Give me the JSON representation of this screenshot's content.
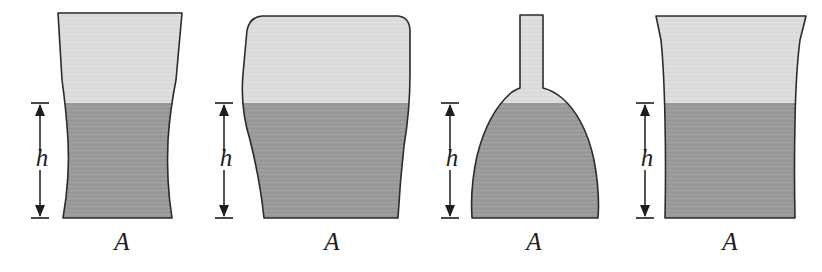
{
  "figure": {
    "colors": {
      "background": "#ffffff",
      "liquid_fill": "#9a9a9a",
      "air_fill": "#dcdcdc",
      "outline": "#2b2b2b",
      "dimension": "#1d1d1d"
    },
    "geometry": {
      "surface_y": 103,
      "base_y": 218,
      "depth_label_y": 166,
      "area_label_y": 250
    },
    "vessels": [
      {
        "id": "vessel-1",
        "shape_name": "waisted-hourglass-vessel",
        "outline_path": "M 58 13 L 182 13 L 176 80 Q 170 110 168 140 Q 166 180 172 218 L 63 218 Q 70 178 68 140 Q 66 108 62 80 Z",
        "depth_label": "h",
        "area_label": "A",
        "depth_label_x": 42,
        "area_label_x": 122,
        "arrow_x": 40
      },
      {
        "id": "vessel-2",
        "shape_name": "bulged-top-tapered-vessel",
        "outline_path": "M 262 16 Q 250 17 247 30 L 243 74 Q 240 108 250 140 Q 260 180 264 218 L 398 218 Q 400 182 404 146 Q 410 110 410 74 L 410 30 Q 409 17 398 16 Z",
        "depth_label": "h",
        "area_label": "A",
        "depth_label_x": 226,
        "area_label_x": 332,
        "arrow_x": 224
      },
      {
        "id": "vessel-3",
        "shape_name": "funnel-dome-vessel-with-neck",
        "outline_path": "M 520 15 L 543 15 L 543 88 Q 552 90 562 98 Q 585 118 594 160 Q 600 192 598 218 L 472 218 Q 470 188 477 156 Q 488 112 512 92 Q 517 89 520 88 Z",
        "depth_label": "h",
        "area_label": "A",
        "depth_label_x": 452,
        "area_label_x": 534,
        "arrow_x": 450
      },
      {
        "id": "vessel-4",
        "shape_name": "straight-sided-vessel",
        "outline_path": "M 656 16 L 806 16 L 800 40 Q 796 70 795 120 Q 794 170 795 218 L 665 218 Q 666 170 665 120 Q 664 70 661 40 Z",
        "depth_label": "h",
        "area_label": "A",
        "depth_label_x": 647,
        "area_label_x": 730,
        "arrow_x": 645
      }
    ]
  }
}
